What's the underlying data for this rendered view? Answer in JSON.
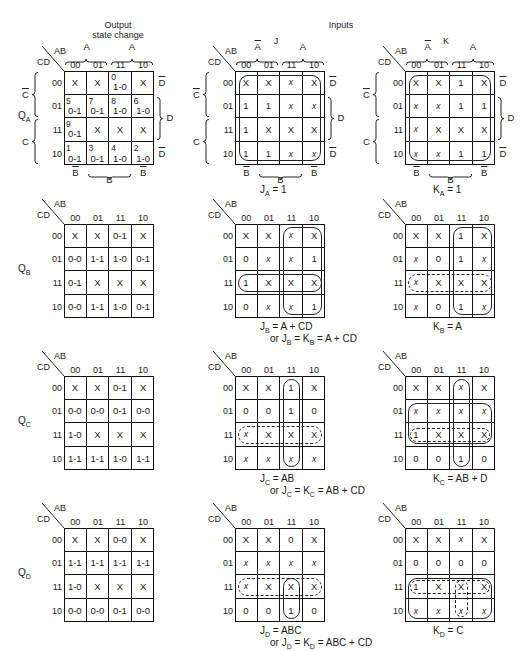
{
  "headers": {
    "output": "Output\nstate change",
    "output_line1": "Output",
    "output_line2": "state change",
    "inputs": "Inputs",
    "j": "J",
    "k": "K"
  },
  "axis": {
    "ab": "AB",
    "cd": "CD",
    "cols": [
      "00",
      "01",
      "11",
      "10"
    ],
    "rows": [
      "00",
      "01",
      "11",
      "10"
    ],
    "col_groups": {
      "a_bar": "A",
      "a": "A",
      "b_bar": "B",
      "b": "B"
    },
    "row_groups": {
      "c_bar": "C",
      "c": "C",
      "d_bar": "D",
      "d": "D"
    }
  },
  "flip_flops": [
    {
      "name": "Q",
      "sub": "A",
      "output_map": [
        [
          {
            "v": "X"
          },
          {
            "v": "X"
          },
          {
            "i": "0",
            "v": "1-0"
          },
          {
            "v": "X"
          }
        ],
        [
          {
            "i": "5",
            "v": "0-1"
          },
          {
            "i": "7",
            "v": "0-1"
          },
          {
            "i": "8",
            "v": "1-0"
          },
          {
            "i": "6",
            "v": "1-0"
          }
        ],
        [
          {
            "i": "9",
            "v": "0-1"
          },
          {
            "v": "X"
          },
          {
            "v": "X"
          },
          {
            "v": "X"
          }
        ],
        [
          {
            "i": "1",
            "v": "0-1"
          },
          {
            "i": "3",
            "v": "0-1"
          },
          {
            "i": "4",
            "v": "1-0"
          },
          {
            "i": "2",
            "v": "1-0"
          }
        ]
      ],
      "j_map": [
        [
          "X",
          "X",
          "x",
          "X"
        ],
        [
          "1",
          "1",
          "x",
          "x"
        ],
        [
          "1",
          "X",
          "X",
          "X"
        ],
        [
          "1",
          "1",
          "x",
          "x"
        ]
      ],
      "k_map": [
        [
          "X",
          "X",
          "1",
          "X"
        ],
        [
          "x",
          "x",
          "1",
          "1"
        ],
        [
          "x",
          "X",
          "X",
          "X"
        ],
        [
          "x",
          "x",
          "1",
          "1"
        ]
      ],
      "j_eq": {
        "lhs": "J",
        "sub": "A",
        "rhs": "= 1"
      },
      "k_eq": {
        "lhs": "K",
        "sub": "A",
        "rhs": "= 1"
      },
      "combined": null
    },
    {
      "name": "Q",
      "sub": "B",
      "output_map": [
        [
          {
            "v": "X"
          },
          {
            "v": "X"
          },
          {
            "v": "0-1"
          },
          {
            "v": "X"
          }
        ],
        [
          {
            "v": "0-0"
          },
          {
            "v": "1-1"
          },
          {
            "v": "1-0"
          },
          {
            "v": "0-1"
          }
        ],
        [
          {
            "v": "0-1"
          },
          {
            "v": "X"
          },
          {
            "v": "X"
          },
          {
            "v": "X"
          }
        ],
        [
          {
            "v": "0-0"
          },
          {
            "v": "1-1"
          },
          {
            "v": "1-0"
          },
          {
            "v": "0-1"
          }
        ]
      ],
      "j_map": [
        [
          "X",
          "X",
          "x",
          "X"
        ],
        [
          "0",
          "x",
          "x",
          "1"
        ],
        [
          "1",
          "X",
          "X",
          "X"
        ],
        [
          "0",
          "x",
          "x",
          "1"
        ]
      ],
      "k_map": [
        [
          "X",
          "X",
          "1",
          "X"
        ],
        [
          "x",
          "0",
          "1",
          "x"
        ],
        [
          "x",
          "X",
          "X",
          "X"
        ],
        [
          "x",
          "0",
          "1",
          "x"
        ]
      ],
      "j_eq": {
        "lhs": "J",
        "sub": "B",
        "rhs": "= A + CD"
      },
      "k_eq": {
        "lhs": "K",
        "sub": "B",
        "rhs": "= A"
      },
      "combined": {
        "pre": "or J",
        "sub1": "B",
        "mid": "= K",
        "sub2": "B",
        "rhs": "= A + CD"
      }
    },
    {
      "name": "Q",
      "sub": "C",
      "output_map": [
        [
          {
            "v": "X"
          },
          {
            "v": "X"
          },
          {
            "v": "0-1"
          },
          {
            "v": "X"
          }
        ],
        [
          {
            "v": "0-0"
          },
          {
            "v": "0-0"
          },
          {
            "v": "0-1"
          },
          {
            "v": "0-0"
          }
        ],
        [
          {
            "v": "1-0"
          },
          {
            "v": "X"
          },
          {
            "v": "X"
          },
          {
            "v": "X"
          }
        ],
        [
          {
            "v": "1-1"
          },
          {
            "v": "1-1"
          },
          {
            "v": "1-0"
          },
          {
            "v": "1-1"
          }
        ]
      ],
      "j_map": [
        [
          "X",
          "X",
          "1",
          "X"
        ],
        [
          "0",
          "0",
          "1",
          "0"
        ],
        [
          "x",
          "X",
          "X",
          "X"
        ],
        [
          "x",
          "x",
          "x",
          "x"
        ]
      ],
      "k_map": [
        [
          "X",
          "X",
          "x",
          "X"
        ],
        [
          "x",
          "x",
          "x",
          "x"
        ],
        [
          "1",
          "X",
          "X",
          "X"
        ],
        [
          "0",
          "0",
          "1",
          "0"
        ]
      ],
      "j_eq": {
        "lhs": "J",
        "sub": "C",
        "rhs": "= AB"
      },
      "k_eq": {
        "lhs": "K",
        "sub": "C",
        "rhs": "= AB + D"
      },
      "combined": {
        "pre": "or J",
        "sub1": "C",
        "mid": "= K",
        "sub2": "C",
        "rhs": "= AB + CD"
      }
    },
    {
      "name": "Q",
      "sub": "D",
      "output_map": [
        [
          {
            "v": "X"
          },
          {
            "v": "X"
          },
          {
            "v": "0-0"
          },
          {
            "v": "X"
          }
        ],
        [
          {
            "v": "1-1"
          },
          {
            "v": "1-1"
          },
          {
            "v": "1-1"
          },
          {
            "v": "1-1"
          }
        ],
        [
          {
            "v": "1-0"
          },
          {
            "v": "X"
          },
          {
            "v": "X"
          },
          {
            "v": "X"
          }
        ],
        [
          {
            "v": "0-0"
          },
          {
            "v": "0-0"
          },
          {
            "v": "0-1"
          },
          {
            "v": "0-0"
          }
        ]
      ],
      "j_map": [
        [
          "X",
          "X",
          "0",
          "X"
        ],
        [
          "x",
          "x",
          "x",
          "x"
        ],
        [
          "x",
          "X",
          "X",
          "X"
        ],
        [
          "0",
          "0",
          "1",
          "0"
        ]
      ],
      "k_map": [
        [
          "X",
          "X",
          "x",
          "X"
        ],
        [
          "0",
          "0",
          "0",
          "0"
        ],
        [
          "1",
          "X",
          "X",
          "X"
        ],
        [
          "x",
          "x",
          "x",
          "x"
        ]
      ],
      "j_eq": {
        "lhs": "J",
        "sub": "D",
        "rhs": "= ABC"
      },
      "k_eq": {
        "lhs": "K",
        "sub": "D",
        "rhs": "= C"
      },
      "combined": {
        "pre": "or J",
        "sub1": "D",
        "mid": "= K",
        "sub2": "D",
        "rhs": "= ABC + CD"
      }
    }
  ]
}
